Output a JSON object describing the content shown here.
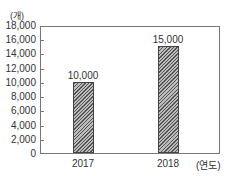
{
  "chart_data": {
    "type": "bar",
    "title": "",
    "categories": [
      "2017",
      "2018"
    ],
    "values": [
      10000,
      15000
    ],
    "value_labels": [
      "10,000",
      "15,000"
    ],
    "xlabel": "(연도)",
    "ylabel": "(개)",
    "ylim": [
      0,
      18000
    ],
    "yticks": [
      "0",
      "2,000",
      "4,000",
      "6,000",
      "8,000",
      "10,000",
      "12,000",
      "14,000",
      "16,000",
      "18,000"
    ],
    "grid": false,
    "legend": null,
    "bar_fill": "diagonal-hatch",
    "bar_color": "#555555"
  }
}
